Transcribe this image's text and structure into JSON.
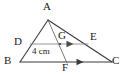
{
  "figure": {
    "kind": "geometry-diagram",
    "shape": "triangle",
    "background_color": "#ffffff",
    "stroke_color": "#3a3a3a",
    "midsegment_color": "#8a8a8a",
    "text_color": "#1a1a1a",
    "vertices": [
      {
        "id": "A",
        "label": "A",
        "x": 48,
        "y": 20,
        "label_x": 43,
        "label_y": 1
      },
      {
        "id": "B",
        "label": "B",
        "x": 20,
        "y": 62,
        "label_x": 4,
        "label_y": 55
      },
      {
        "id": "C",
        "label": "C",
        "x": 112,
        "y": 62,
        "label_x": 112,
        "label_y": 55
      },
      {
        "id": "D",
        "label": "D",
        "x": 30,
        "y": 44,
        "label_x": 14,
        "label_y": 36
      },
      {
        "id": "E",
        "label": "E",
        "x": 88,
        "y": 44,
        "label_x": 90,
        "label_y": 31
      },
      {
        "id": "F",
        "label": "F",
        "x": 67,
        "y": 62,
        "label_x": 62,
        "label_y": 62
      },
      {
        "id": "G",
        "label": "G",
        "x": 60,
        "y": 44,
        "label_x": 58,
        "label_y": 30
      }
    ],
    "segments": [
      {
        "id": "AB",
        "from": "A",
        "to": "B",
        "style": "solid",
        "color": "#3a3a3a"
      },
      {
        "id": "AC",
        "from": "A",
        "to": "C",
        "style": "solid",
        "color": "#3a3a3a"
      },
      {
        "id": "BC",
        "from": "B",
        "to": "C",
        "style": "solid",
        "color": "#3a3a3a"
      },
      {
        "id": "AF",
        "from": "A",
        "to": "F",
        "style": "solid",
        "color": "#6a6a6a"
      },
      {
        "id": "DE",
        "from": "D",
        "to": "E",
        "style": "solid",
        "color": "#8a8a8a"
      }
    ],
    "parallel_marks": [
      {
        "id": "mark-on-DE",
        "on_segment": "DE",
        "x": 70,
        "y": 44,
        "direction": "right"
      },
      {
        "id": "mark-on-BC",
        "on_segment": "BC",
        "x": 80,
        "y": 62,
        "direction": "right"
      }
    ],
    "measurements": [
      {
        "id": "DG-length",
        "on_segment": "DG",
        "value": "4 cm",
        "x": 32,
        "y": 47
      }
    ]
  }
}
